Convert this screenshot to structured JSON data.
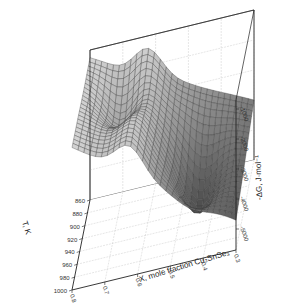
{
  "chart_data": {
    "type": "surface3d",
    "title": "",
    "xlabel": "X, mole fraction Cu₂SnSe₃",
    "ylabel": "T, K",
    "zlabel": "-ΔG, J·mol⁻¹",
    "x_ticks": [
      "0.8",
      "0.7",
      "0.6",
      "0.5",
      "0.4",
      "0.3"
    ],
    "y_ticks": [
      "860",
      "880",
      "900",
      "920",
      "940",
      "960",
      "980",
      "1000"
    ],
    "z_ticks": [
      "-1000",
      "-2000",
      "-3000",
      "-4000",
      "-5000"
    ],
    "xlim": [
      0.3,
      0.8
    ],
    "ylim": [
      860,
      1000
    ],
    "zlim": [
      -5000,
      0
    ],
    "grid": true,
    "colormap": "grayscale (light at high, dark at low)"
  }
}
